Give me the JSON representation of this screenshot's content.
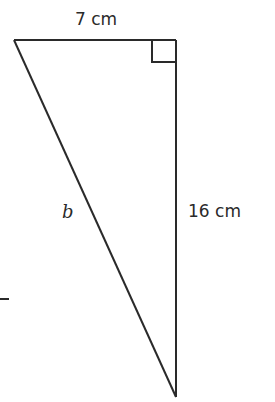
{
  "figure": {
    "type": "right-triangle",
    "labels": {
      "top_side": "7 cm",
      "right_side": "16 cm",
      "hypotenuse": "b"
    },
    "right_angle_marker": true,
    "colors": {
      "line": "#2a2a2a",
      "background": "#ffffff"
    }
  }
}
